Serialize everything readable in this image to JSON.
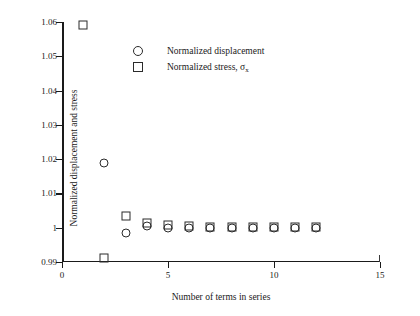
{
  "chart_data": {
    "type": "scatter",
    "title": "",
    "xlabel": "Number of terms in series",
    "ylabel": "Normalized displacement  and stress",
    "xlim": [
      0,
      15
    ],
    "ylim": [
      0.99,
      1.06
    ],
    "xticks": [
      0,
      5,
      10,
      15
    ],
    "xtick_labels": [
      "0",
      "5",
      "10",
      "15"
    ],
    "yticks": [
      0.99,
      1.0,
      1.01,
      1.02,
      1.03,
      1.04,
      1.05,
      1.06
    ],
    "ytick_labels": [
      "0.99",
      "1",
      "1.01",
      "1.02",
      "1.03",
      "1.04",
      "1.05",
      "1.06"
    ],
    "grid": false,
    "legend_position": "upper center",
    "series": [
      {
        "name": "Normalized displacement",
        "marker": "circle",
        "x": [
          2,
          3,
          4,
          5,
          6,
          7,
          8,
          9,
          10,
          11,
          12
        ],
        "y": [
          1.019,
          0.9985,
          1.0005,
          1.0,
          0.9998,
          1.0,
          1.0,
          1.0,
          1.0,
          1.0,
          1.0
        ]
      },
      {
        "name": "Normalized stress",
        "marker": "square",
        "x": [
          1,
          2,
          3,
          4,
          5,
          6,
          7,
          8,
          9,
          10,
          11,
          12
        ],
        "y": [
          1.059,
          0.9912,
          1.0035,
          1.0015,
          1.0008,
          1.0005,
          1.0003,
          1.0002,
          1.0002,
          1.0001,
          1.0001,
          1.0001
        ]
      }
    ]
  },
  "legend": {
    "items": [
      {
        "marker": "circle",
        "label": "Normalized displacement",
        "subscript": ""
      },
      {
        "marker": "square",
        "label": "Normalized stress, σ",
        "subscript": "x"
      }
    ]
  }
}
